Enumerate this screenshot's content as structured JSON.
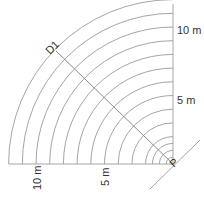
{
  "diagram": {
    "type": "quarter-circle distance arcs",
    "origin_label": "P",
    "diagonal_label": "D1",
    "scale_px_per_m": 13.7,
    "arc_radii_m": [
      0.5,
      1,
      1.5,
      2,
      3,
      4,
      5,
      6,
      7,
      8,
      9,
      10,
      11,
      12
    ],
    "vertical_axis_labels": [
      {
        "text": "10 m",
        "value": 10
      },
      {
        "text": "5 m",
        "value": 5
      }
    ],
    "horizontal_axis_labels": [
      {
        "text": "10 m",
        "value": 10
      },
      {
        "text": "5 m",
        "value": 5
      }
    ],
    "colors": {
      "lines": "#9a9a9a",
      "text": "#333333",
      "background": "#ffffff"
    }
  }
}
